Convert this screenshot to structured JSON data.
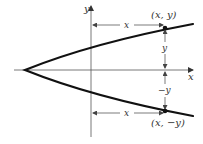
{
  "diagram": {
    "type": "parabola-symmetry",
    "axes": {
      "x_label": "x",
      "y_label": "y"
    },
    "points": {
      "upper": {
        "label": "(x, y)"
      },
      "lower": {
        "label": "(x, −y)"
      }
    },
    "measures": {
      "upper_horizontal": "x",
      "lower_horizontal": "x",
      "upper_vertical": "y",
      "lower_vertical": "−y"
    },
    "colors": {
      "curve": "#111111",
      "axis": "#444444",
      "text": "#333333"
    }
  }
}
